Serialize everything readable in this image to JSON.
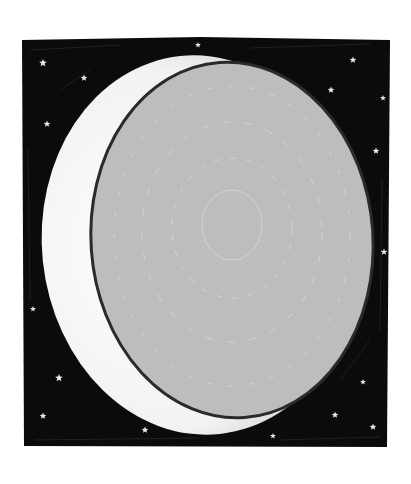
{
  "illustration": {
    "subject": "crescent moon in starry night sky",
    "colors": {
      "background": "#ffffff",
      "sky": "#0b0b0b",
      "crescent": "#f4f4f4",
      "moon_disk": "#bdbdbd",
      "moon_outline": "#2a2a2a",
      "star": "#e8e8e8"
    },
    "stars": [
      {
        "x": 43,
        "y": 63,
        "r": 4
      },
      {
        "x": 84,
        "y": 78,
        "r": 3.5
      },
      {
        "x": 47,
        "y": 124,
        "r": 3.5
      },
      {
        "x": 198,
        "y": 45,
        "r": 3
      },
      {
        "x": 353,
        "y": 60,
        "r": 3.5
      },
      {
        "x": 331,
        "y": 90,
        "r": 3.5
      },
      {
        "x": 383,
        "y": 98,
        "r": 3
      },
      {
        "x": 376,
        "y": 151,
        "r": 3.5
      },
      {
        "x": 384,
        "y": 252,
        "r": 3.5
      },
      {
        "x": 33,
        "y": 309,
        "r": 3
      },
      {
        "x": 59,
        "y": 378,
        "r": 4
      },
      {
        "x": 43,
        "y": 416,
        "r": 3.5
      },
      {
        "x": 145,
        "y": 430,
        "r": 3.5
      },
      {
        "x": 363,
        "y": 382,
        "r": 3
      },
      {
        "x": 335,
        "y": 415,
        "r": 3.5
      },
      {
        "x": 373,
        "y": 427,
        "r": 3.5
      },
      {
        "x": 273,
        "y": 436,
        "r": 3
      }
    ]
  }
}
